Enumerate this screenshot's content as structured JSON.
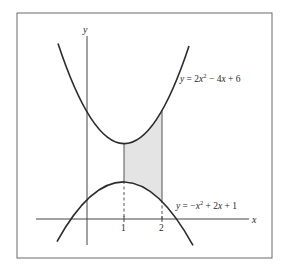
{
  "figure": {
    "axes": {
      "x_label": "x",
      "y_label": "y",
      "x_ticks": [
        "1",
        "2"
      ]
    },
    "curves": [
      {
        "name": "upper-parabola",
        "equation": "y = 2x² − 4x + 6",
        "label_parts": {
          "lhs": "y",
          "eq": " = 2",
          "var1": "x",
          "exp": "2",
          "rest": " − 4",
          "var2": "x",
          "tail": " + 6"
        }
      },
      {
        "name": "lower-parabola",
        "equation": "y = −x² + 2x + 1",
        "label_parts": {
          "lhs": "y",
          "eq": " = −",
          "var1": "x",
          "exp": "2",
          "rest": " + 2",
          "var2": "x",
          "tail": " + 1"
        }
      }
    ],
    "shaded_region": {
      "x_from": "1",
      "x_to": "2",
      "fill": "#e4e4e4"
    },
    "colors": {
      "curve": "#2b2b2b",
      "axis": "#444444",
      "frame": "#6b6b6b"
    }
  }
}
